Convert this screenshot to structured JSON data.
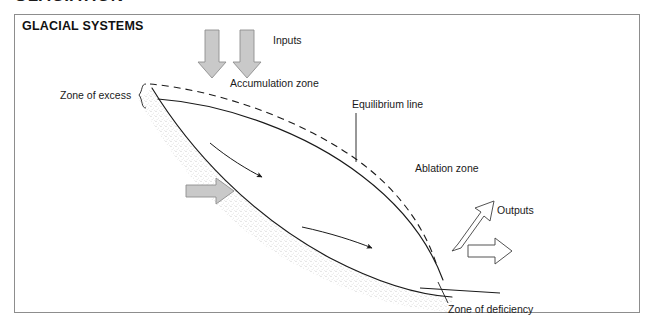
{
  "page": {
    "cut_off_heading": "GLACIATION",
    "box_title": "GLACIAL SYSTEMS"
  },
  "labels": {
    "inputs": "Inputs",
    "accumulation_zone": "Accumulation zone",
    "zone_of_excess": "Zone of excess",
    "equilibrium_line": "Equilibrium line",
    "ablation_zone": "Ablation zone",
    "outputs": "Outputs",
    "zone_of_deficiency": "Zone of deficiency"
  },
  "colors": {
    "box_border": "#8d8d8d",
    "text": "#1a1a1a",
    "gray_arrow_fill": "#c9c9c9",
    "gray_arrow_stroke": "#8a8a8a",
    "line": "#1a1a1a",
    "stipple": "#b8b8b8",
    "background": "#ffffff"
  },
  "diagram": {
    "type": "concept-diagram",
    "elements": [
      {
        "name": "input-arrow-1",
        "kind": "filled-gray-arrow",
        "direction": "down"
      },
      {
        "name": "input-arrow-2",
        "kind": "filled-gray-arrow",
        "direction": "down"
      },
      {
        "name": "glacier-surface-dashed",
        "kind": "dashed-curve"
      },
      {
        "name": "glacier-upper-solid",
        "kind": "solid-curve"
      },
      {
        "name": "glacier-bed-solid",
        "kind": "solid-curve"
      },
      {
        "name": "stipple-band",
        "kind": "texture"
      },
      {
        "name": "flow-arrow-upper",
        "kind": "thin-curved-arrow",
        "direction": "down-right"
      },
      {
        "name": "flow-arrow-lower",
        "kind": "thin-curved-arrow",
        "direction": "right"
      },
      {
        "name": "basal-slide-arrow",
        "kind": "filled-gray-arrow",
        "direction": "right"
      },
      {
        "name": "output-arrow-diagonal",
        "kind": "outline-arrow",
        "direction": "up-right"
      },
      {
        "name": "output-arrow-horizontal",
        "kind": "outline-arrow",
        "direction": "right"
      },
      {
        "name": "equilibrium-leader",
        "kind": "leader-line"
      },
      {
        "name": "zone-of-excess-brace",
        "kind": "brace"
      },
      {
        "name": "zone-of-deficiency-leader",
        "kind": "leader-line"
      }
    ]
  }
}
